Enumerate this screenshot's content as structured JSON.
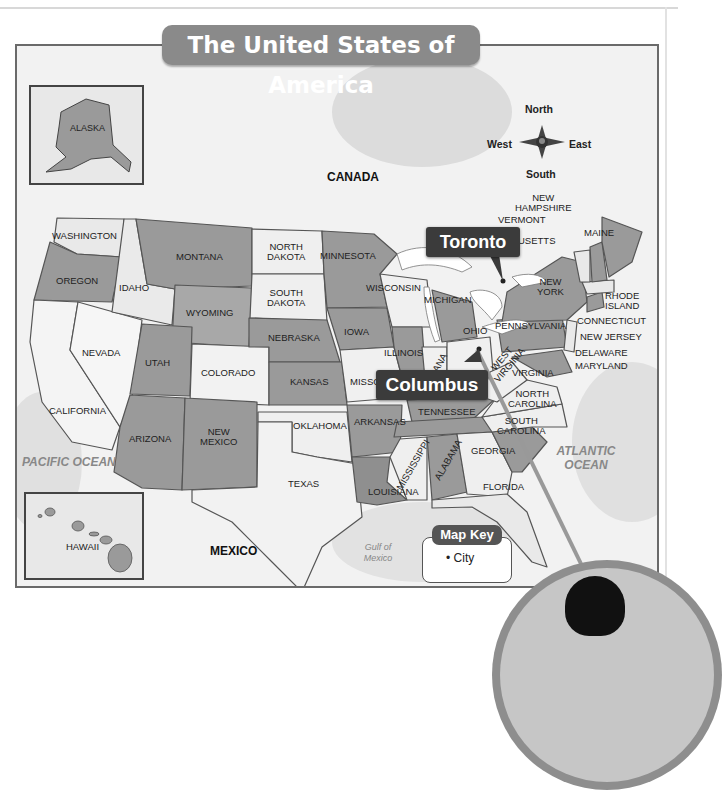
{
  "title": "The United States of America",
  "compass": {
    "north": "North",
    "south": "South",
    "east": "East",
    "west": "West"
  },
  "callouts": {
    "toronto": "Toronto",
    "columbus": "Columbus"
  },
  "regions": {
    "canada": "CANADA",
    "mexico": "MEXICO",
    "pacific": "PACIFIC OCEAN",
    "atlantic": "ATLANTIC OCEAN",
    "gulf": "Gulf of Mexico"
  },
  "insets": {
    "alaska": "ALASKA",
    "hawaii": "HAWAII"
  },
  "map_key": {
    "title": "Map Key",
    "item": "City",
    "bullet": "•"
  },
  "states": {
    "washington": "WASHINGTON",
    "oregon": "OREGON",
    "california": "CALIFORNIA",
    "idaho": "IDAHO",
    "nevada": "NEVADA",
    "montana": "MONTANA",
    "wyoming": "WYOMING",
    "utah": "UTAH",
    "arizona": "ARIZONA",
    "colorado": "COLORADO",
    "new_mexico_1": "NEW",
    "new_mexico_2": "MEXICO",
    "north_dakota_1": "NORTH",
    "north_dakota_2": "DAKOTA",
    "south_dakota_1": "SOUTH",
    "south_dakota_2": "DAKOTA",
    "nebraska": "NEBRASKA",
    "kansas": "KANSAS",
    "oklahoma": "OKLAHOMA",
    "texas": "TEXAS",
    "minnesota": "MINNESOTA",
    "iowa": "IOWA",
    "missouri": "MISSO",
    "arkansas": "ARKANSAS",
    "louisiana": "LOUISIANA",
    "wisconsin": "WISCONSIN",
    "illinois": "ILLINOIS",
    "michigan": "MICHIGAN",
    "indiana": "INDIANA",
    "ohio": "OHIO",
    "kentucky": "",
    "tennessee": "TENNESSEE",
    "mississippi": "MISSISSIPPI",
    "alabama": "ALABAMA",
    "georgia": "GEORGIA",
    "florida": "FLORIDA",
    "south_carolina_1": "SOUTH",
    "south_carolina_2": "CAROLINA",
    "north_carolina_1": "NORTH",
    "north_carolina_2": "CAROLINA",
    "virginia": "VIRGINIA",
    "west_virginia_1": "WEST",
    "west_virginia_2": "VIRGINIA",
    "pennsylvania": "PENNSYLVANIA",
    "new_york_1": "NEW",
    "new_york_2": "YORK",
    "vermont": "VERMONT",
    "new_hampshire_1": "NEW",
    "new_hampshire_2": "HAMPSHIRE",
    "maine": "MAINE",
    "massachusetts": "USETTS",
    "rhode_island_1": "RHODE",
    "rhode_island_2": "ISLAND",
    "connecticut": "CONNECTICUT",
    "new_jersey": "NEW JERSEY",
    "delaware": "DELAWARE",
    "maryland": "MARYLAND"
  },
  "colors": {
    "dark_state": "#9a9a9a",
    "light_state": "#e9e9e9",
    "callout": "#3b3b3b",
    "title_bg": "#8a8a8a"
  }
}
